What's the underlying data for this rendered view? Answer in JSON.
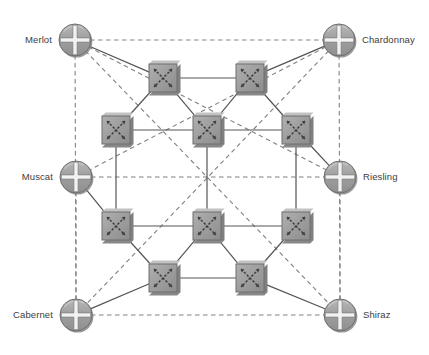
{
  "diagram": {
    "type": "network-topology",
    "canvas": {
      "width": 429,
      "height": 355,
      "background": "#ffffff"
    },
    "colors": {
      "device_fill": "#9a9a9a",
      "device_fill_light": "#b4b4b4",
      "device_stroke": "#6e6e6e",
      "device_shadow": "#7a7a7a",
      "glyph": "#ffffff",
      "glyph_dark": "#4a4a4a",
      "solid_link": "#555555",
      "dashed_link": "#808080",
      "label_text": "#3d3d3d"
    },
    "legend": {
      "solid_link_meaning": "physical link",
      "dashed_link_meaning": "logical full-mesh link"
    }
  },
  "routers": [
    {
      "id": "merlot",
      "label": "Merlot",
      "icon": "router-icon",
      "x": 75,
      "y": 40,
      "r": 16,
      "label_side": "left"
    },
    {
      "id": "chardonnay",
      "label": "Chardonnay",
      "icon": "router-icon",
      "x": 339,
      "y": 40,
      "r": 16,
      "label_side": "right"
    },
    {
      "id": "muscat",
      "label": "Muscat",
      "icon": "router-icon",
      "x": 76,
      "y": 177,
      "r": 16,
      "label_side": "left"
    },
    {
      "id": "riesling",
      "label": "Riesling",
      "icon": "router-icon",
      "x": 340,
      "y": 177,
      "r": 16,
      "label_side": "right"
    },
    {
      "id": "cabernet",
      "label": "Cabernet",
      "icon": "router-icon",
      "x": 76,
      "y": 315,
      "r": 16,
      "label_side": "left"
    },
    {
      "id": "shiraz",
      "label": "Shiraz",
      "icon": "router-icon",
      "x": 340,
      "y": 315,
      "r": 16,
      "label_side": "right"
    }
  ],
  "switches": [
    {
      "id": "sw-top-left",
      "icon": "switch-icon",
      "x": 163,
      "y": 78,
      "size": 28
    },
    {
      "id": "sw-top-right",
      "icon": "switch-icon",
      "x": 250,
      "y": 78,
      "size": 28
    },
    {
      "id": "sw-upper-left",
      "icon": "switch-icon",
      "x": 116,
      "y": 130,
      "size": 28
    },
    {
      "id": "sw-upper-center",
      "icon": "switch-icon",
      "x": 207,
      "y": 130,
      "size": 28
    },
    {
      "id": "sw-upper-right",
      "icon": "switch-icon",
      "x": 296,
      "y": 130,
      "size": 28
    },
    {
      "id": "sw-lower-left",
      "icon": "switch-icon",
      "x": 116,
      "y": 226,
      "size": 28
    },
    {
      "id": "sw-lower-center",
      "icon": "switch-icon",
      "x": 207,
      "y": 226,
      "size": 28
    },
    {
      "id": "sw-lower-right",
      "icon": "switch-icon",
      "x": 296,
      "y": 226,
      "size": 28
    },
    {
      "id": "sw-bottom-left",
      "icon": "switch-icon",
      "x": 163,
      "y": 278,
      "size": 28
    },
    {
      "id": "sw-bottom-right",
      "icon": "switch-icon",
      "x": 250,
      "y": 278,
      "size": 28
    }
  ],
  "solid_links": [
    {
      "from": "merlot",
      "to": "sw-top-left"
    },
    {
      "from": "chardonnay",
      "to": "sw-top-right"
    },
    {
      "from": "muscat",
      "to": "sw-lower-left"
    },
    {
      "from": "riesling",
      "to": "sw-upper-right"
    },
    {
      "from": "cabernet",
      "to": "sw-bottom-left"
    },
    {
      "from": "shiraz",
      "to": "sw-bottom-right"
    },
    {
      "from": "sw-top-left",
      "to": "sw-top-right"
    },
    {
      "from": "sw-top-left",
      "to": "sw-upper-left"
    },
    {
      "from": "sw-top-left",
      "to": "sw-upper-center"
    },
    {
      "from": "sw-top-right",
      "to": "sw-upper-center"
    },
    {
      "from": "sw-top-right",
      "to": "sw-upper-right"
    },
    {
      "from": "sw-upper-left",
      "to": "sw-upper-center"
    },
    {
      "from": "sw-upper-center",
      "to": "sw-upper-right"
    },
    {
      "from": "sw-upper-left",
      "to": "sw-lower-left"
    },
    {
      "from": "sw-upper-center",
      "to": "sw-lower-center"
    },
    {
      "from": "sw-upper-right",
      "to": "sw-lower-right"
    },
    {
      "from": "sw-lower-left",
      "to": "sw-lower-center"
    },
    {
      "from": "sw-lower-center",
      "to": "sw-lower-right"
    },
    {
      "from": "sw-lower-left",
      "to": "sw-bottom-left"
    },
    {
      "from": "sw-lower-center",
      "to": "sw-bottom-left"
    },
    {
      "from": "sw-lower-center",
      "to": "sw-bottom-right"
    },
    {
      "from": "sw-lower-right",
      "to": "sw-bottom-right"
    },
    {
      "from": "sw-bottom-left",
      "to": "sw-bottom-right"
    }
  ],
  "dashed_links": [
    {
      "from": "merlot",
      "to": "chardonnay"
    },
    {
      "from": "merlot",
      "to": "cabernet"
    },
    {
      "from": "merlot",
      "to": "riesling"
    },
    {
      "from": "merlot",
      "to": "shiraz"
    },
    {
      "from": "chardonnay",
      "to": "shiraz"
    },
    {
      "from": "chardonnay",
      "to": "muscat"
    },
    {
      "from": "chardonnay",
      "to": "cabernet"
    },
    {
      "from": "muscat",
      "to": "riesling"
    },
    {
      "from": "muscat",
      "to": "cabernet"
    },
    {
      "from": "riesling",
      "to": "shiraz"
    },
    {
      "from": "cabernet",
      "to": "shiraz"
    }
  ]
}
